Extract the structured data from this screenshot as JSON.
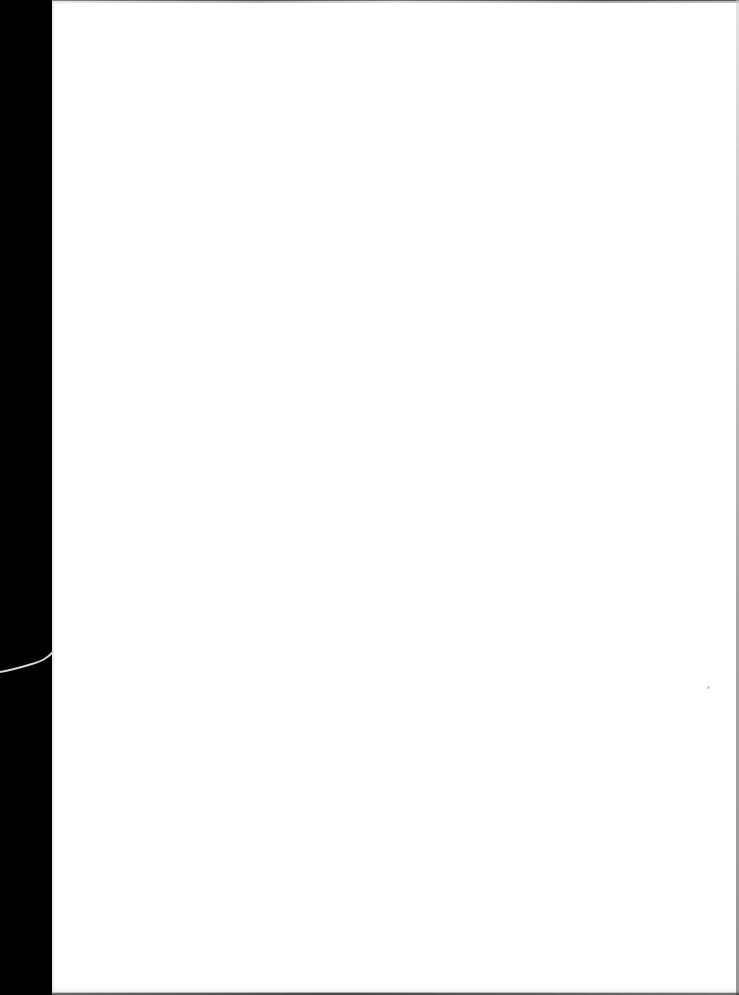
{
  "scene": {
    "description": "Blank white sheet of paper on a black background",
    "background_color": "#000000",
    "paper_color": "#ffffff",
    "objects": [
      {
        "name": "paper-sheet",
        "text": ""
      },
      {
        "name": "hair-fiber",
        "location": "left edge"
      },
      {
        "name": "dust-speck",
        "location": "right middle"
      }
    ]
  }
}
